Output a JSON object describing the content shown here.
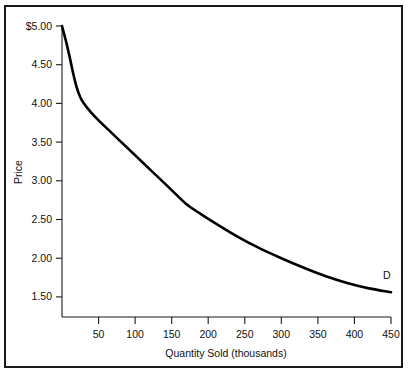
{
  "chart_data": {
    "type": "line",
    "title": "",
    "subtitle": "",
    "xlabel": "Quantity Sold (thousands)",
    "ylabel": "Price",
    "xlim": [
      0,
      450
    ],
    "ylim": [
      1.2,
      5.0
    ],
    "grid": false,
    "legend_position": "none",
    "x_ticks": [
      50,
      100,
      150,
      200,
      250,
      300,
      350,
      400,
      450
    ],
    "x_tick_labels": [
      "50",
      "100",
      "150",
      "200",
      "250",
      "300",
      "350",
      "400",
      "450"
    ],
    "y_ticks": [
      5.0,
      4.5,
      4.0,
      3.5,
      3.0,
      2.5,
      2.0,
      1.5
    ],
    "y_tick_labels": [
      "$5.00",
      "4.50",
      "4.00",
      "3.50",
      "3.00",
      "2.50",
      "2.00",
      "1.50"
    ],
    "series": [
      {
        "name": "D",
        "annotation": "D",
        "x": [
          0,
          5,
          10,
          15,
          20,
          25,
          30,
          40,
          50,
          70,
          90,
          110,
          130,
          150,
          170,
          190,
          210,
          240,
          270,
          300,
          330,
          360,
          390,
          420,
          450
        ],
        "y": [
          5.0,
          4.82,
          4.62,
          4.4,
          4.21,
          4.08,
          4.0,
          3.88,
          3.78,
          3.6,
          3.42,
          3.24,
          3.06,
          2.88,
          2.7,
          2.57,
          2.45,
          2.28,
          2.13,
          2.0,
          1.88,
          1.77,
          1.68,
          1.61,
          1.56
        ]
      }
    ],
    "annotations": [
      {
        "text": "D",
        "x": 450,
        "y": 1.73
      }
    ]
  },
  "figure": {
    "frame": true,
    "background_color": "#ffffff",
    "line_color": "#000000",
    "axis_color": "#1a1a1a"
  }
}
